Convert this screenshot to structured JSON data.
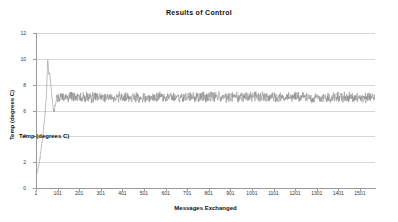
{
  "chart_data": {
    "type": "line",
    "title": "Results of Control",
    "xlabel": "Messages Exchanged",
    "ylabel": "Temp (degrees C)",
    "ylabel_duplicate": "Temp (degrees C)",
    "xlim": [
      1,
      1571
    ],
    "ylim": [
      0,
      12
    ],
    "grid": true,
    "legend": "none",
    "xticks": [
      1,
      101,
      201,
      301,
      401,
      501,
      601,
      701,
      801,
      901,
      1001,
      1101,
      1201,
      1301,
      1401,
      1501
    ],
    "xtick_labels": [
      "1",
      "101",
      "201",
      "301",
      "401",
      "501",
      "601",
      "701",
      "801",
      "901",
      "1001",
      "1101",
      "1201",
      "1301",
      "1401",
      "1501"
    ],
    "yticks": [
      0,
      2,
      4,
      6,
      8,
      10,
      12
    ],
    "ytick_labels": [
      "0",
      "2",
      "4",
      "6",
      "8",
      "10",
      "12"
    ],
    "series": [
      {
        "name": "Temp",
        "color": "#8a8a8a",
        "x": [
          1,
          8,
          15,
          22,
          28,
          34,
          38,
          42,
          45,
          48,
          50,
          52,
          54,
          56,
          58,
          60,
          63,
          66,
          69,
          72,
          75,
          78,
          81,
          84,
          87,
          90,
          94,
          98,
          102,
          106,
          110,
          115,
          120,
          126,
          132,
          140,
          150,
          160,
          175,
          190,
          210,
          230,
          260,
          300,
          350,
          420,
          500,
          600,
          700,
          800,
          900,
          1000,
          1100,
          1200,
          1300,
          1400,
          1500,
          1571
        ],
        "values": [
          1.0,
          1.3,
          1.9,
          2.6,
          3.4,
          4.2,
          4.9,
          5.6,
          6.3,
          6.9,
          7.4,
          8.3,
          9.4,
          10.05,
          9.4,
          8.6,
          9.0,
          8.7,
          8.2,
          7.6,
          7.0,
          6.6,
          6.2,
          5.95,
          6.1,
          6.4,
          6.8,
          7.1,
          7.0,
          6.8,
          6.9,
          7.1,
          7.0,
          7.05,
          7.0,
          7.1,
          7.0,
          7.05,
          7.0,
          7.05,
          7.0,
          7.05,
          7.0,
          7.05,
          7.0,
          7.05,
          7.0,
          7.05,
          7.0,
          7.05,
          7.0,
          7.05,
          7.0,
          7.05,
          7.0,
          7.05,
          7.0,
          7.0
        ],
        "steady_state_mean": 7.0,
        "steady_state_noise_amplitude": 0.6,
        "steady_state_start_x": 100
      }
    ]
  }
}
